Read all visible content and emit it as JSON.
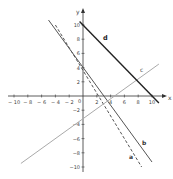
{
  "chart_data": {
    "type": "line",
    "title": "",
    "xlabel": "x",
    "ylabel": "y",
    "xlim": [
      -11,
      11
    ],
    "ylim": [
      -11,
      11
    ],
    "grid": false,
    "x_ticks": [
      -10,
      -8,
      -6,
      -4,
      -2,
      2,
      4,
      6,
      8,
      10
    ],
    "y_ticks": [
      10,
      8,
      6,
      4,
      2,
      -2,
      -4,
      -6,
      -8,
      -10
    ],
    "x_tick_labels": [
      "-10",
      "-8",
      "-6",
      "-4",
      "-2",
      "2",
      "4",
      "6",
      "8",
      "10"
    ],
    "y_tick_labels": [
      "10",
      "8",
      "6",
      "4",
      "2",
      "-2",
      "-4",
      "-6",
      "-8",
      "-10"
    ],
    "origin_label": "0",
    "series": [
      {
        "name": "a",
        "style": "dashed",
        "color": "#555555",
        "x": [
          -4,
          8.5
        ],
        "y": [
          10,
          -10
        ]
      },
      {
        "name": "b",
        "style": "solid",
        "color": "#555555",
        "x": [
          -5,
          10
        ],
        "y": [
          10.7,
          -9.3
        ]
      },
      {
        "name": "c",
        "style": "solid",
        "color": "#aaaaaa",
        "x": [
          -9,
          11
        ],
        "y": [
          -9.5,
          4.5
        ]
      },
      {
        "name": "d",
        "style": "solid",
        "color": "#222222",
        "x": [
          -0.5,
          11
        ],
        "y": [
          10.5,
          -1
        ]
      }
    ],
    "labels": {
      "a": "a",
      "b": "b",
      "c": "c",
      "d": "d"
    }
  }
}
